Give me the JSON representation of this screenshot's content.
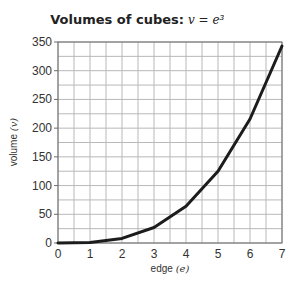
{
  "chart_data": {
    "type": "line",
    "title": "Volumes of cubes:",
    "title_formula": "v = e³",
    "xlabel": "edge",
    "xlabel_var": "(e)",
    "ylabel": "volume",
    "ylabel_var": "(v)",
    "xlim": [
      0,
      7
    ],
    "ylim": [
      0,
      350
    ],
    "x_ticks": [
      0,
      1,
      2,
      3,
      4,
      5,
      6,
      7
    ],
    "y_ticks": [
      0,
      50,
      100,
      150,
      200,
      250,
      300,
      350
    ],
    "x_minor_step": 0.5,
    "y_minor_step": 25,
    "grid": true,
    "legend": "none",
    "series": [
      {
        "name": "v = e^3",
        "color": "#1c1c1c",
        "x": [
          0,
          1,
          2,
          3,
          4,
          5,
          6,
          7
        ],
        "y": [
          0,
          1,
          8,
          27,
          64,
          125,
          216,
          343
        ]
      }
    ]
  }
}
